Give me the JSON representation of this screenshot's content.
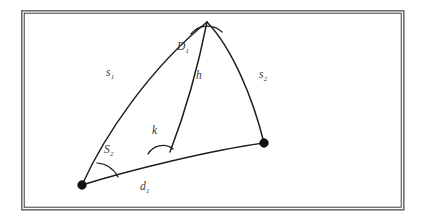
{
  "figure": {
    "background_color": "#ffffff",
    "stroke_color": "#1c1c1e",
    "label_color": "#3a3a3e",
    "frame": {
      "name": "outer-border",
      "x": 21,
      "y": 10,
      "width": 383,
      "height": 200,
      "border_color": "#6e6e72"
    },
    "labels": [
      {
        "id": "s1",
        "base": "s",
        "sub": "1",
        "x": 106,
        "y": 76,
        "name": "label-side-s1"
      },
      {
        "id": "D1",
        "base": "D",
        "sub": "1",
        "x": 177,
        "y": 50,
        "name": "label-angle-D1"
      },
      {
        "id": "h",
        "base": "h",
        "sub": "",
        "x": 196,
        "y": 79,
        "name": "label-altitude-h"
      },
      {
        "id": "s2",
        "base": "s",
        "sub": "2",
        "x": 259,
        "y": 78,
        "name": "label-side-s2"
      },
      {
        "id": "k",
        "base": "k",
        "sub": "",
        "x": 152,
        "y": 134,
        "name": "label-angle-k"
      },
      {
        "id": "S2",
        "base": "S",
        "sub": "2",
        "x": 104,
        "y": 153,
        "name": "label-angle-S2"
      },
      {
        "id": "d1",
        "base": "d",
        "sub": "1",
        "x": 140,
        "y": 190,
        "name": "label-base-d1"
      }
    ],
    "vertices": [
      {
        "id": "left",
        "x": 82,
        "y": 185,
        "r": 4.4,
        "name": "vertex-dot-left"
      },
      {
        "id": "right",
        "x": 264,
        "y": 143,
        "r": 4.4,
        "name": "vertex-dot-right"
      }
    ],
    "apex": {
      "x": 207,
      "y": 22
    },
    "curves": [
      {
        "id": "side-s1",
        "name": "curve-side-s1",
        "d": "M 82 185 C 104 136 150 68 207 22"
      },
      {
        "id": "side-s2",
        "name": "curve-side-s2",
        "d": "M 207 22 C 232 48 253 98 264 143"
      },
      {
        "id": "base-d1",
        "name": "curve-base-d1",
        "d": "M 82 185 C 130 170 212 150 264 143"
      },
      {
        "id": "altitude-h",
        "name": "curve-altitude-h",
        "d": "M 170 152 C 185 113 199 62 207 22"
      }
    ],
    "angle_arcs": [
      {
        "id": "arc-S2",
        "name": "angle-arc-S2",
        "d": "M 104 168 A 24 24 0 0 1 120 174"
      },
      {
        "id": "arc-k",
        "name": "angle-arc-k",
        "d": "M 151 158 A 19 19 0 0 1 170 152"
      },
      {
        "id": "arc-D1",
        "name": "angle-arc-D1",
        "d": "M 194 32 A 19 19 0 0 1 221 31"
      }
    ]
  }
}
